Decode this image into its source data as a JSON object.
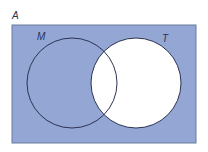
{
  "diagram": {
    "type": "venn",
    "universe_label": "A",
    "sets": [
      {
        "label": "M",
        "shaded": true
      },
      {
        "label": "T",
        "shaded": false
      }
    ],
    "shaded_region": "A minus T (universe outside T, including M only)",
    "colors": {
      "fill": "#94a6d4",
      "outline": "#2b3352",
      "unshaded": "#ffffff"
    }
  }
}
